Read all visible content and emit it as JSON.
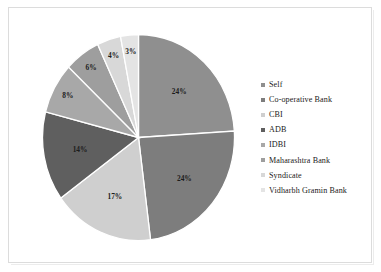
{
  "chart_data": {
    "type": "pie",
    "title": "",
    "categories": [
      "Self",
      "Co-operative Bank",
      "CBI",
      "ADB",
      "IDBI",
      "Maharashtra Bank",
      "Syndicate",
      "Vidharbh Gramin Bank"
    ],
    "values": [
      24,
      24,
      17,
      14,
      8,
      6,
      4,
      3
    ],
    "value_labels": [
      "24%",
      "24%",
      "17%",
      "14%",
      "8%",
      "6%",
      "4%",
      "3%"
    ],
    "unit": "%",
    "start_angle_deg": 0,
    "direction": "clockwise",
    "legend_position": "right",
    "grid": false,
    "slice_colors": [
      "#8f8f8f",
      "#7d7d7d",
      "#cfcfcf",
      "#5f5f5f",
      "#a8a8a8",
      "#9e9e9e",
      "#d8d8d8",
      "#e4e4e4"
    ],
    "slice_border_color": "#ffffff"
  },
  "legend": {
    "marker_icon": "square-marker-icon",
    "items": [
      {
        "label": "Self",
        "color": "#8f8f8f"
      },
      {
        "label": "Co-operative Bank",
        "color": "#7d7d7d"
      },
      {
        "label": "CBI",
        "color": "#cfcfcf"
      },
      {
        "label": "ADB",
        "color": "#5f5f5f"
      },
      {
        "label": "IDBI",
        "color": "#a8a8a8"
      },
      {
        "label": "Maharashtra Bank",
        "color": "#9e9e9e"
      },
      {
        "label": "Syndicate",
        "color": "#d8d8d8"
      },
      {
        "label": "Vidharbh Gramin Bank",
        "color": "#e4e4e4"
      }
    ]
  },
  "figure": {
    "background_color": "#ffffff",
    "border_color": "#dcdcdc"
  }
}
